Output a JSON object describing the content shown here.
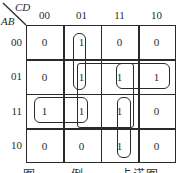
{
  "kmap": {
    "row_var": "AB",
    "col_var": "CD",
    "col_labels": [
      "00",
      "01",
      "11",
      "10"
    ],
    "row_labels": [
      "00",
      "01",
      "11",
      "10"
    ],
    "cells": [
      [
        "0",
        "1",
        "0",
        "0"
      ],
      [
        "0",
        "1",
        "1",
        "1"
      ],
      [
        "1",
        "1",
        "1",
        "0"
      ],
      [
        "0",
        "0",
        "1",
        "0"
      ]
    ],
    "groups": [
      {
        "name": "col01-rows00-01",
        "rows": [
          "00",
          "01"
        ],
        "cols": [
          "01"
        ]
      },
      {
        "name": "row01-cols11-10",
        "rows": [
          "01"
        ],
        "cols": [
          "11",
          "10"
        ]
      },
      {
        "name": "row11-cols00-01",
        "rows": [
          "11"
        ],
        "cols": [
          "00",
          "01"
        ]
      },
      {
        "name": "col11-rows11-10",
        "rows": [
          "11",
          "10"
        ],
        "cols": [
          "11"
        ]
      },
      {
        "name": "quad-cols01-11-rows01-11",
        "rows": [
          "01",
          "11"
        ],
        "cols": [
          "01",
          "11"
        ]
      }
    ]
  },
  "caption": "图 ……  例 …… 卡诺图"
}
